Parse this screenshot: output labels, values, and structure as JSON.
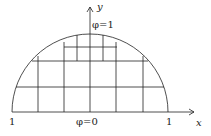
{
  "diagram": {
    "axes": {
      "x_label": "x",
      "y_label": "y"
    },
    "labels": {
      "left_tick": "1",
      "right_tick": "1",
      "bottom_boundary": "φ=0",
      "top_boundary": "φ=1"
    },
    "colors": {
      "stroke": "#222222",
      "background": "#ffffff"
    }
  }
}
